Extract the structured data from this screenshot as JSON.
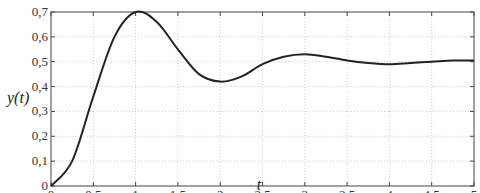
{
  "chart_data": {
    "type": "line",
    "title": "",
    "xlabel": "t",
    "ylabel": "y(t)",
    "xlim": [
      0,
      5
    ],
    "ylim": [
      0,
      0.7
    ],
    "grid": true,
    "legend": null,
    "x_ticks": [
      "0",
      "0,5",
      "1",
      "1,5",
      "2",
      "2,5",
      "3",
      "3,5",
      "4",
      "4,5",
      "5"
    ],
    "y_ticks": [
      "0",
      "0,1",
      "0,2",
      "0,3",
      "0,4",
      "0,5",
      "0,6",
      "0,7"
    ],
    "series": [
      {
        "name": "y(t)",
        "color": "#222222",
        "x": [
          0,
          0.25,
          0.5,
          0.75,
          1.0,
          1.25,
          1.5,
          1.75,
          2.0,
          2.25,
          2.5,
          2.75,
          3.0,
          3.25,
          3.5,
          3.75,
          4.0,
          4.25,
          4.5,
          4.75,
          5.0
        ],
        "values": [
          0,
          0.1,
          0.36,
          0.6,
          0.7,
          0.66,
          0.55,
          0.45,
          0.42,
          0.44,
          0.49,
          0.52,
          0.53,
          0.52,
          0.505,
          0.495,
          0.49,
          0.495,
          0.5,
          0.505,
          0.505
        ]
      }
    ]
  }
}
